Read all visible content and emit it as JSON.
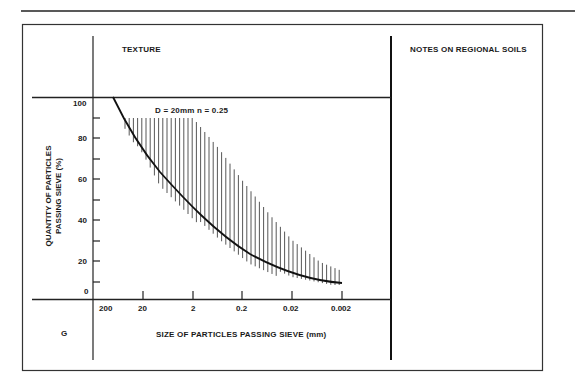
{
  "header": {
    "texture_label": "TEXTURE",
    "notes_label": "NOTES ON REGIONAL SOILS",
    "group_label": "G"
  },
  "chart_data": {
    "type": "line",
    "title": "",
    "annotation": "D = 20mm   n = 0.25",
    "xlabel": "SIZE OF PARTICLES PASSING SIEVE (mm)",
    "ylabel_line1": "QUANTITY OF PARTICLES",
    "ylabel_line2": "PASSING SIEVE (%)",
    "x_scale": "log (reversed)",
    "x_ticks": [
      "200",
      "20",
      "2",
      "0.2",
      "0.02",
      "0.002"
    ],
    "y_ticks": [
      "0",
      "20",
      "40",
      "60",
      "80",
      "100"
    ],
    "y_minor_ticks": [
      10,
      30,
      50,
      70,
      90
    ],
    "ylim": [
      0,
      100
    ],
    "grid": false,
    "legend": "none",
    "series": [
      {
        "name": "Fuller curve D=20mm n=0.25",
        "style": "solid",
        "x": [
          20,
          10,
          5,
          2,
          1,
          0.5,
          0.2,
          0.1,
          0.05,
          0.02,
          0.01,
          0.005,
          0.002
        ],
        "y": [
          100,
          88,
          77,
          65,
          56,
          48,
          39,
          33,
          28,
          22,
          18,
          14,
          9
        ]
      },
      {
        "name": "Hatched band upper bound",
        "style": "hatched",
        "x": [
          30,
          20,
          10,
          5,
          2,
          1,
          0.5,
          0.2,
          0.1,
          0.05,
          0.02,
          0.01,
          0.005,
          0.002
        ],
        "y": [
          90,
          90,
          90,
          90,
          90,
          82,
          72,
          58,
          48,
          38,
          28,
          22,
          17,
          13
        ]
      }
    ]
  }
}
